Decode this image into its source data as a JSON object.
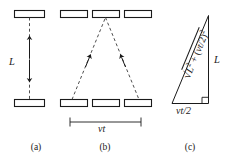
{
  "figure": {
    "stroke_color": "#1a1a1a",
    "dash_color": "#3a3a3a",
    "background": "#ffffff"
  },
  "panels": [
    {
      "id": "a",
      "caption": "(a)",
      "description": "Light clock at rest: vertical dashed path between two horizontal mirrors",
      "length_label": "L",
      "mirrors": 2
    },
    {
      "id": "b",
      "caption": "(b)",
      "description": "Moving light clock: diagonal dashed path between three positions of mirrors",
      "distance_label": "vt",
      "mirrors": 6
    },
    {
      "id": "c",
      "caption": "(c)",
      "description": "Right triangle relating the path lengths",
      "hypotenuse_label": "√L² + (vt/2)²",
      "vertical_label": "L",
      "base_label": "vt/2",
      "right_angle": true
    }
  ],
  "labels": {
    "panel_a_L": "L",
    "panel_b_vt": "vt",
    "panel_c_L": "L",
    "panel_c_base": "vt/2",
    "panel_c_hyp_radical": "√",
    "panel_c_hyp_body": "L",
    "panel_c_hyp_exp1": "2",
    "panel_c_hyp_plus": " + (",
    "panel_c_hyp_vt": "vt",
    "panel_c_hyp_half": "/2)",
    "panel_c_hyp_exp2": "2",
    "caption_a": "(a)",
    "caption_b": "(b)",
    "caption_c": "(c)"
  }
}
